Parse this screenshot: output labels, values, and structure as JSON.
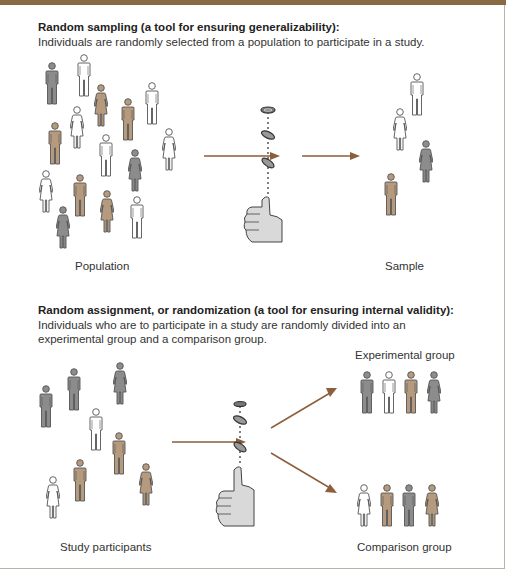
{
  "colors": {
    "header_bar": "#8a6a45",
    "arrow": "#8b5e3c",
    "gray_figure": "#8c8c8c",
    "brown_figure": "#b59a7e",
    "white_figure": "#ffffff",
    "outline": "#555555",
    "hand": "#d9d9d9"
  },
  "section1": {
    "heading": "Random sampling (a tool for ensuring generalizability):",
    "description": "Individuals are randomly selected from a population to participate in a study.",
    "population_label": "Population",
    "sample_label": "Sample",
    "population": [
      {
        "type": "man",
        "color": "gray",
        "x": 45,
        "y": 62
      },
      {
        "type": "man",
        "color": "white",
        "x": 77,
        "y": 54
      },
      {
        "type": "woman",
        "color": "brown",
        "x": 94,
        "y": 84
      },
      {
        "type": "man",
        "color": "brown",
        "x": 121,
        "y": 98
      },
      {
        "type": "man",
        "color": "white",
        "x": 145,
        "y": 82
      },
      {
        "type": "woman",
        "color": "white",
        "x": 70,
        "y": 106
      },
      {
        "type": "man",
        "color": "brown",
        "x": 48,
        "y": 122
      },
      {
        "type": "man",
        "color": "white",
        "x": 99,
        "y": 134
      },
      {
        "type": "woman",
        "color": "white",
        "x": 162,
        "y": 128
      },
      {
        "type": "woman",
        "color": "gray",
        "x": 128,
        "y": 149
      },
      {
        "type": "woman",
        "color": "white",
        "x": 39,
        "y": 170
      },
      {
        "type": "man",
        "color": "brown",
        "x": 73,
        "y": 174
      },
      {
        "type": "woman",
        "color": "brown",
        "x": 100,
        "y": 190
      },
      {
        "type": "man",
        "color": "white",
        "x": 130,
        "y": 196
      },
      {
        "type": "woman",
        "color": "gray",
        "x": 56,
        "y": 206
      }
    ],
    "sample": [
      {
        "type": "man",
        "color": "white",
        "x": 410,
        "y": 73
      },
      {
        "type": "woman",
        "color": "white",
        "x": 393,
        "y": 108
      },
      {
        "type": "woman",
        "color": "gray",
        "x": 419,
        "y": 140
      },
      {
        "type": "man",
        "color": "brown",
        "x": 384,
        "y": 173
      }
    ]
  },
  "section2": {
    "heading": "Random assignment, or randomization (a tool for ensuring internal validity):",
    "description_line1": "Individuals who are to participate in a study are randomly divided into an",
    "description_line2": "experimental group and a comparison group.",
    "participants_label": "Study participants",
    "experimental_label": "Experimental group",
    "comparison_label": "Comparison group",
    "participants": [
      {
        "type": "man",
        "color": "gray",
        "x": 39,
        "y": 385
      },
      {
        "type": "man",
        "color": "gray",
        "x": 67,
        "y": 368
      },
      {
        "type": "woman",
        "color": "gray",
        "x": 113,
        "y": 362
      },
      {
        "type": "man",
        "color": "white",
        "x": 89,
        "y": 408
      },
      {
        "type": "man",
        "color": "brown",
        "x": 112,
        "y": 432
      },
      {
        "type": "man",
        "color": "brown",
        "x": 73,
        "y": 459
      },
      {
        "type": "woman",
        "color": "brown",
        "x": 139,
        "y": 463
      },
      {
        "type": "woman",
        "color": "white",
        "x": 46,
        "y": 476
      }
    ],
    "experimental": [
      {
        "type": "man",
        "color": "gray",
        "x": 360,
        "y": 371
      },
      {
        "type": "man",
        "color": "white",
        "x": 382,
        "y": 371
      },
      {
        "type": "man",
        "color": "brown",
        "x": 404,
        "y": 371
      },
      {
        "type": "woman",
        "color": "gray",
        "x": 427,
        "y": 371
      }
    ],
    "comparison": [
      {
        "type": "woman",
        "color": "white",
        "x": 357,
        "y": 484
      },
      {
        "type": "man",
        "color": "brown",
        "x": 380,
        "y": 484
      },
      {
        "type": "man",
        "color": "gray",
        "x": 402,
        "y": 484
      },
      {
        "type": "woman",
        "color": "brown",
        "x": 425,
        "y": 484
      }
    ]
  }
}
